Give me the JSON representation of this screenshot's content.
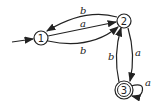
{
  "diagram": {
    "type": "finite-automaton",
    "states": [
      {
        "id": "1",
        "label": "1",
        "start": true,
        "accepting": false
      },
      {
        "id": "2",
        "label": "2",
        "start": false,
        "accepting": false
      },
      {
        "id": "3",
        "label": "3",
        "start": false,
        "accepting": true
      }
    ],
    "transitions": [
      {
        "from": "2",
        "to": "1",
        "label": "b"
      },
      {
        "from": "1",
        "to": "2",
        "label": "a"
      },
      {
        "from": "1",
        "to": "2",
        "label": "b"
      },
      {
        "from": "2",
        "to": "3",
        "label": "a"
      },
      {
        "from": "3",
        "to": "2",
        "label": "b"
      },
      {
        "from": "3",
        "to": "3",
        "label": "a"
      }
    ]
  }
}
